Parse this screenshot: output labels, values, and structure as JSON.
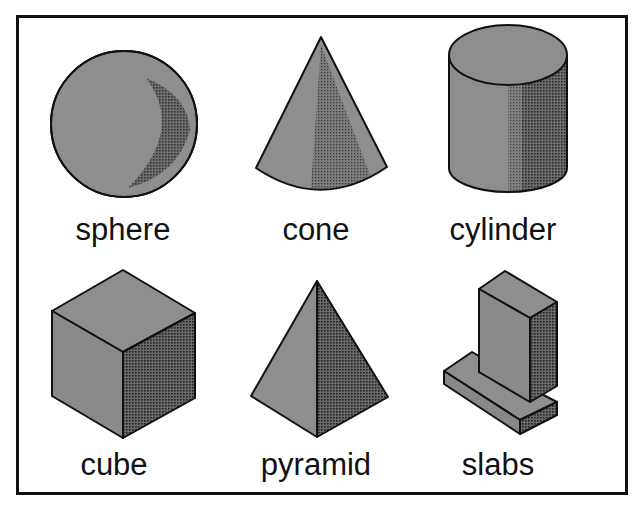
{
  "figure": {
    "colors": {
      "frame": "#111111",
      "outline": "#111111",
      "face_light": "#8e8e8e",
      "face_dark": "#5a5a5a",
      "halftone_dot": "#222222",
      "label": "#111111",
      "background": "#ffffff"
    },
    "shapes": [
      {
        "id": "sphere",
        "label": "sphere",
        "row": 1,
        "col": 1
      },
      {
        "id": "cone",
        "label": "cone",
        "row": 1,
        "col": 2
      },
      {
        "id": "cylinder",
        "label": "cylinder",
        "row": 1,
        "col": 3
      },
      {
        "id": "cube",
        "label": "cube",
        "row": 2,
        "col": 1
      },
      {
        "id": "pyramid",
        "label": "pyramid",
        "row": 2,
        "col": 2
      },
      {
        "id": "slabs",
        "label": "slabs",
        "row": 2,
        "col": 3
      }
    ]
  }
}
